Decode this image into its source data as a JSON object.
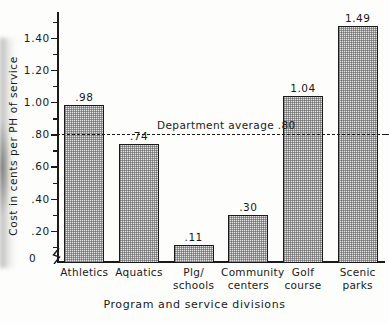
{
  "chart_data": {
    "type": "bar",
    "title": "",
    "xlabel": "Program and service divisions",
    "ylabel": "Cost in cents per PH of service",
    "categories": [
      "Athletics",
      "Aquatics",
      "Plg/ schools",
      "Community centers",
      "Golf course",
      "Scenic parks"
    ],
    "category_lines": [
      [
        "Athletics"
      ],
      [
        "Aquatics"
      ],
      [
        "Plg/",
        "schools"
      ],
      [
        "Community",
        "centers"
      ],
      [
        "Golf",
        "course"
      ],
      [
        "Scenic",
        "parks"
      ]
    ],
    "values": [
      0.98,
      0.74,
      0.11,
      0.3,
      1.04,
      1.49
    ],
    "value_labels": [
      ".98",
      ".74",
      ".11",
      ".30",
      "1.04",
      "1.49"
    ],
    "ylim": [
      0,
      1.56
    ],
    "ytick_values": [
      0.2,
      0.4,
      0.6,
      0.8,
      1.0,
      1.2,
      1.4
    ],
    "ytick_labels": [
      ".20",
      ".40",
      ".60",
      ".80",
      "1.00",
      "1.20",
      "1.40"
    ],
    "yminor_values": [
      0.1,
      0.3,
      0.5,
      0.7,
      0.9,
      1.1,
      1.3,
      1.5
    ],
    "zero_label": "0",
    "grid": false,
    "legend": false,
    "annotations": [
      {
        "name": "department-average",
        "label": "Department average .80",
        "value": 0.8,
        "style": "dashed-horizontal-line"
      }
    ],
    "colors": {
      "bar_fill": "#e2e2e2",
      "bar_stroke": "#1a1a1a",
      "axis": "#1a1a1a",
      "text": "#1a1a1a",
      "background": "#fdfdfb"
    }
  }
}
